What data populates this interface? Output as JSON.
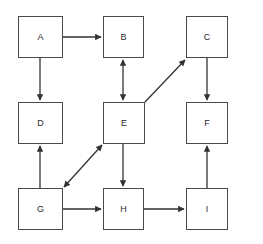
{
  "diagram": {
    "type": "flowchart",
    "canvas": {
      "width": 263,
      "height": 244,
      "background": "#ffffff"
    },
    "style": {
      "node_fill": "#ffffff",
      "node_border": "#4a4a4a",
      "edge_color": "#333333",
      "label_color": "#2b2b2b"
    },
    "nodes": [
      {
        "id": "A",
        "label": "A",
        "x": 18,
        "y": 16,
        "w": 45,
        "h": 42
      },
      {
        "id": "B",
        "label": "B",
        "x": 103,
        "y": 16,
        "w": 41,
        "h": 42
      },
      {
        "id": "C",
        "label": "C",
        "x": 186,
        "y": 16,
        "w": 42,
        "h": 42
      },
      {
        "id": "D",
        "label": "D",
        "x": 18,
        "y": 102,
        "w": 45,
        "h": 42
      },
      {
        "id": "E",
        "label": "E",
        "x": 103,
        "y": 102,
        "w": 42,
        "h": 42
      },
      {
        "id": "F",
        "label": "F",
        "x": 186,
        "y": 102,
        "w": 42,
        "h": 42
      },
      {
        "id": "G",
        "label": "G",
        "x": 18,
        "y": 188,
        "w": 45,
        "h": 42
      },
      {
        "id": "H",
        "label": "H",
        "x": 103,
        "y": 188,
        "w": 41,
        "h": 42
      },
      {
        "id": "I",
        "label": "I",
        "x": 186,
        "y": 188,
        "w": 42,
        "h": 42
      }
    ],
    "edges": [
      {
        "id": "a-to-b",
        "from": "A",
        "to": "B",
        "direction": "forward",
        "orientation": "horizontal"
      },
      {
        "id": "a-to-d",
        "from": "A",
        "to": "D",
        "direction": "forward",
        "orientation": "vertical"
      },
      {
        "id": "b-e",
        "from": "B",
        "to": "E",
        "direction": "bidirectional",
        "orientation": "vertical"
      },
      {
        "id": "e-to-c",
        "from": "E",
        "to": "C",
        "direction": "forward",
        "orientation": "diagonal"
      },
      {
        "id": "c-to-f",
        "from": "C",
        "to": "F",
        "direction": "forward",
        "orientation": "vertical"
      },
      {
        "id": "g-to-d",
        "from": "G",
        "to": "D",
        "direction": "forward",
        "orientation": "vertical"
      },
      {
        "id": "g-e",
        "from": "G",
        "to": "E",
        "direction": "bidirectional",
        "orientation": "diagonal"
      },
      {
        "id": "e-to-h",
        "from": "E",
        "to": "H",
        "direction": "forward",
        "orientation": "vertical"
      },
      {
        "id": "g-to-h",
        "from": "G",
        "to": "H",
        "direction": "forward",
        "orientation": "horizontal"
      },
      {
        "id": "h-to-i",
        "from": "H",
        "to": "I",
        "direction": "forward",
        "orientation": "horizontal"
      },
      {
        "id": "i-to-f",
        "from": "I",
        "to": "F",
        "direction": "forward",
        "orientation": "vertical"
      }
    ]
  }
}
